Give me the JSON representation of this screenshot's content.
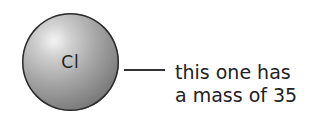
{
  "atom": {
    "symbol": "Cl",
    "color": "#9a9a9a"
  },
  "annotation": {
    "line1": "this one has",
    "line2": "a mass of 35"
  }
}
